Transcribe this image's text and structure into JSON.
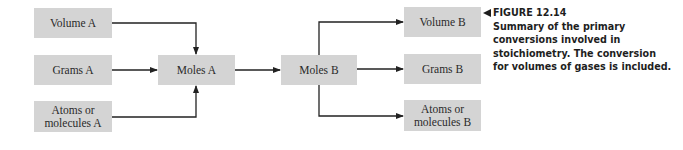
{
  "diagram": {
    "nodes": {
      "volume_a": "Volume A",
      "grams_a": "Grams A",
      "atoms_a": "Atoms or molecules A",
      "atoms_a_line1": "Atoms or",
      "atoms_a_line2": "molecules A",
      "moles_a": "Moles A",
      "moles_b": "Moles B",
      "volume_b": "Volume B",
      "grams_b": "Grams B",
      "atoms_b": "Atoms or molecules B",
      "atoms_b_line1": "Atoms or",
      "atoms_b_line2": "molecules B"
    },
    "edges": [
      {
        "from": "Volume A",
        "to": "Moles A"
      },
      {
        "from": "Grams A",
        "to": "Moles A"
      },
      {
        "from": "Atoms or molecules A",
        "to": "Moles A"
      },
      {
        "from": "Moles A",
        "to": "Moles B"
      },
      {
        "from": "Moles B",
        "to": "Volume B"
      },
      {
        "from": "Moles B",
        "to": "Grams B"
      },
      {
        "from": "Moles B",
        "to": "Atoms or molecules B"
      }
    ],
    "colors": {
      "box_fill": "#d4d4d4",
      "line": "#222222",
      "text": "#2a2a2a"
    }
  },
  "caption": {
    "figure_label": "FIGURE 12.14",
    "text": "Summary of the primary conversions involved in stoichiometry. The conversion for volumes of gases is included.",
    "lines": [
      "Summary of the primary",
      "conversions involved in",
      "stoichiometry. The conversion",
      "for volumes of gases is included."
    ]
  }
}
